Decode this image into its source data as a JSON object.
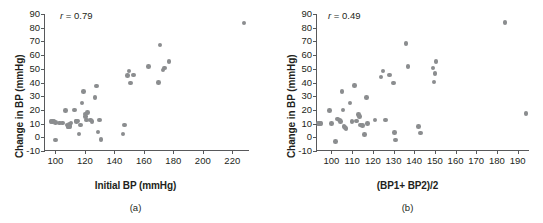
{
  "figure": {
    "panels": [
      {
        "id": "a",
        "caption": "(a)",
        "annotation_r_symbol": "r",
        "annotation_r_value": "= 0.79",
        "chart_data": {
          "type": "scatter",
          "title": "",
          "xlabel": "Initial BP (mmHg)",
          "ylabel": "Change in BP (mmHg)",
          "xlim": [
            93,
            232
          ],
          "ylim": [
            -10,
            90
          ],
          "xticks": [
            100,
            120,
            140,
            160,
            180,
            200,
            220
          ],
          "yticks": [
            -10,
            0,
            10,
            20,
            30,
            40,
            50,
            60,
            70,
            80,
            90
          ],
          "grid": false,
          "legend": "none",
          "marker_color": "#8b8d8f",
          "annotation": "r = 0.79",
          "correlation": 0.79,
          "n_points": 44,
          "points": [
            [
              97,
              11.5
            ],
            [
              98,
              11.5
            ],
            [
              99,
              12
            ],
            [
              100,
              11
            ],
            [
              100,
              -2
            ],
            [
              103,
              10.5
            ],
            [
              105,
              10.5
            ],
            [
              107,
              19.5
            ],
            [
              108,
              9
            ],
            [
              108.5,
              8
            ],
            [
              109,
              7.5
            ],
            [
              109.5,
              9.5
            ],
            [
              110,
              8
            ],
            [
              110.5,
              10.5
            ],
            [
              113,
              20
            ],
            [
              114,
              12
            ],
            [
              114.5,
              11.5
            ],
            [
              115,
              12
            ],
            [
              116,
              2.5
            ],
            [
              117,
              9
            ],
            [
              118,
              25
            ],
            [
              119,
              33.5
            ],
            [
              120,
              17
            ],
            [
              120.5,
              15
            ],
            [
              121,
              12.5
            ],
            [
              122,
              18
            ],
            [
              124,
              12.5
            ],
            [
              125,
              11.5
            ],
            [
              127,
              29
            ],
            [
              128,
              37.5
            ],
            [
              129,
              4
            ],
            [
              130,
              12.5
            ],
            [
              131,
              -1.5
            ],
            [
              146,
              2.5
            ],
            [
              147,
              9
            ],
            [
              149,
              45
            ],
            [
              150,
              48.5
            ],
            [
              151,
              39.5
            ],
            [
              153,
              45.5
            ],
            [
              163,
              51.5
            ],
            [
              170,
              40
            ],
            [
              171,
              67.5
            ],
            [
              173,
              49
            ],
            [
              174,
              50.5
            ],
            [
              177,
              55.5
            ],
            [
              228,
              83.5
            ]
          ]
        }
      },
      {
        "id": "b",
        "caption": "(b)",
        "annotation_r_symbol": "r",
        "annotation_r_value": "= 0.49",
        "chart_data": {
          "type": "scatter",
          "title": "",
          "xlabel": "(BP1+ BP2)/2",
          "ylabel": "Change in BP (mmHg)",
          "xlim": [
            93,
            196
          ],
          "ylim": [
            -10,
            90
          ],
          "xticks": [
            100,
            110,
            120,
            130,
            140,
            150,
            160,
            170,
            180,
            190
          ],
          "yticks": [
            -10,
            0,
            10,
            20,
            30,
            40,
            50,
            60,
            70,
            80,
            90
          ],
          "grid": false,
          "legend": "none",
          "marker_color": "#8b8d8f",
          "annotation": "r = 0.49",
          "correlation": 0.49,
          "n_points": 44,
          "points": [
            [
              93.5,
              10
            ],
            [
              94,
              10
            ],
            [
              94.5,
              10
            ],
            [
              95,
              10
            ],
            [
              99,
              19.5
            ],
            [
              100,
              10
            ],
            [
              102,
              -3
            ],
            [
              103,
              13.5
            ],
            [
              104,
              12.5
            ],
            [
              104.5,
              11.5
            ],
            [
              105,
              33.5
            ],
            [
              105.5,
              20
            ],
            [
              106,
              8
            ],
            [
              106.5,
              7
            ],
            [
              107,
              6.5
            ],
            [
              109,
              25
            ],
            [
              110,
              11.5
            ],
            [
              111,
              38
            ],
            [
              112,
              12
            ],
            [
              113,
              16.5
            ],
            [
              113.5,
              15
            ],
            [
              114,
              9
            ],
            [
              115,
              8.5
            ],
            [
              116,
              2
            ],
            [
              117,
              29
            ],
            [
              117.5,
              10
            ],
            [
              121,
              12.5
            ],
            [
              124,
              44
            ],
            [
              125,
              48.5
            ],
            [
              126,
              12.5
            ],
            [
              128,
              45.5
            ],
            [
              130,
              39.5
            ],
            [
              130.5,
              3.5
            ],
            [
              131,
              -2
            ],
            [
              136,
              68.5
            ],
            [
              137,
              51.5
            ],
            [
              142,
              8
            ],
            [
              143,
              3
            ],
            [
              149,
              50.5
            ],
            [
              149.5,
              40.5
            ],
            [
              150,
              46.5
            ],
            [
              150.5,
              55.5
            ],
            [
              184,
              84
            ],
            [
              194,
              17.5
            ]
          ]
        }
      }
    ]
  }
}
